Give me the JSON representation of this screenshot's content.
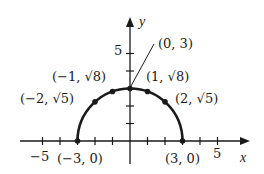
{
  "chart_data": {
    "type": "line",
    "title": "",
    "xlabel": "x",
    "ylabel": "y",
    "xlim": [
      -6,
      7
    ],
    "ylim": [
      0,
      7
    ],
    "grid": false,
    "x_ticks": [
      -5,
      -4,
      -3,
      -2,
      -1,
      0,
      1,
      2,
      3,
      4,
      5
    ],
    "x_tick_labels": [
      {
        "value": -5,
        "label": "−5"
      },
      {
        "value": 5,
        "label": "5"
      }
    ],
    "y_ticks": [
      1,
      2,
      3,
      4,
      5
    ],
    "y_tick_labels": [
      {
        "value": 5,
        "label": "5"
      }
    ],
    "series": [
      {
        "name": "y = sqrt(9 - x^2)",
        "curve": "semicircle",
        "center": [
          0,
          0
        ],
        "radius": 3,
        "points": [
          {
            "x": -3,
            "y": 0,
            "label": "(−3, 0)"
          },
          {
            "x": -2,
            "y": 2.236,
            "label": "(−2, √5)"
          },
          {
            "x": -1,
            "y": 2.828,
            "label": "(−1, √8)"
          },
          {
            "x": 0,
            "y": 3,
            "label": "(0, 3)"
          },
          {
            "x": 1,
            "y": 2.828,
            "label": "(1, √8)"
          },
          {
            "x": 2,
            "y": 2.236,
            "label": "(2, √5)"
          },
          {
            "x": 3,
            "y": 0,
            "label": "(3, 0)"
          }
        ]
      }
    ]
  },
  "labels": {
    "x_axis": "x",
    "y_axis": "y",
    "x_tick_neg5": "−5",
    "x_tick_5": "5",
    "y_tick_5": "5",
    "p_neg3_0": "(−3, 0)",
    "p_neg2": "(−2, √5)",
    "p_neg1": "(−1, √8)",
    "p_0_3": "(0, 3)",
    "p_1": "(1, √8)",
    "p_2": "(2, √5)",
    "p_3_0": "(3, 0)"
  },
  "colors": {
    "ink": "#1a1a1a",
    "background": "#ffffff"
  }
}
